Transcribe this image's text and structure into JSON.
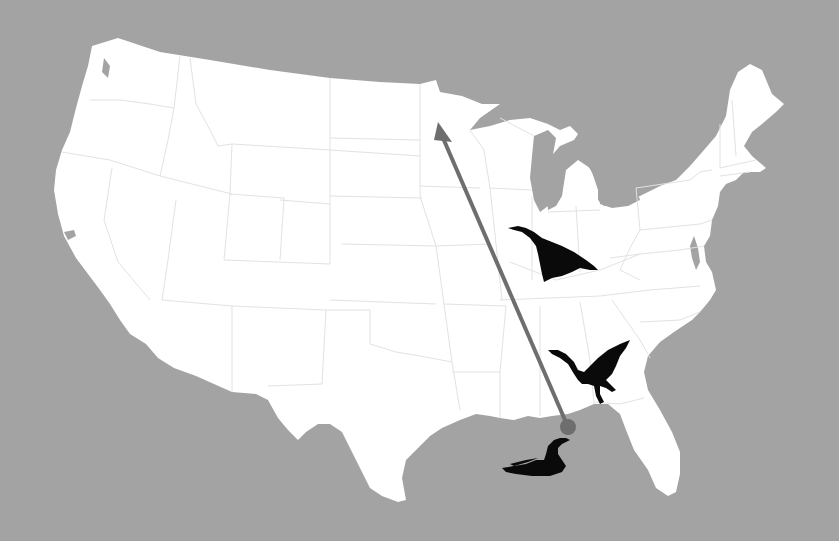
{
  "map": {
    "subject": "Contiguous United States",
    "background_color": "#a3a3a3",
    "land_color": "#ffffff",
    "border_color": "#e2e2e2",
    "route": {
      "description": "Northward migration route from the Gulf Coast to Minnesota",
      "color": "#6e6e6e",
      "start": {
        "x": 568,
        "y": 427,
        "label": "Gulf Coast (Mississippi/Alabama)"
      },
      "end": {
        "x": 438,
        "y": 124,
        "label": "Minnesota"
      }
    },
    "birds": [
      {
        "id": "bird-swimming",
        "icon": "duck-swimming-icon",
        "x": 535,
        "y": 460
      },
      {
        "id": "bird-takeoff",
        "icon": "goose-takeoff-icon",
        "x": 590,
        "y": 375
      },
      {
        "id": "bird-flying",
        "icon": "goose-flying-icon",
        "x": 555,
        "y": 250
      }
    ]
  }
}
